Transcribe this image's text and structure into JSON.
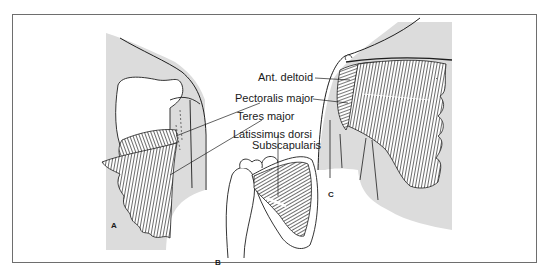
{
  "figure": {
    "colors": {
      "frame": "#6e6e6e",
      "skin_shading": "#dcdcdc",
      "muscle_ink": "#1e1e1e",
      "background": "#ffffff"
    },
    "labels": {
      "ant_deltoid": "Ant. deltoid",
      "pectoralis_major": "Pectoralis major",
      "teres_major": "Teres major",
      "latissimus_dorsi": "Latissimus dorsi",
      "subscapularis": "Subscapularis"
    },
    "panels": {
      "a": "A",
      "b": "B",
      "c": "C"
    }
  }
}
